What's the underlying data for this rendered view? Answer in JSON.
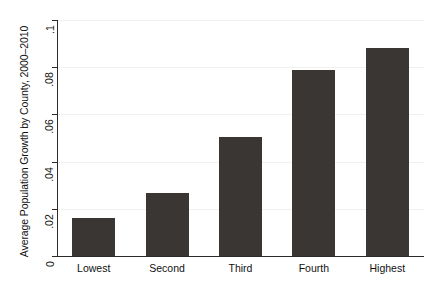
{
  "chart_data": {
    "type": "bar",
    "title": "",
    "xlabel": "",
    "ylabel": "Average Population Growth by County, 2000–2010",
    "categories": [
      "Lowest",
      "Second",
      "Third",
      "Fourth",
      "Highest"
    ],
    "values": [
      0.016,
      0.0265,
      0.0505,
      0.079,
      0.088
    ],
    "ylim": [
      0,
      0.1
    ],
    "yticks": [
      0,
      0.02,
      0.04,
      0.06,
      0.08,
      0.1
    ],
    "ytick_labels": [
      "0",
      ".02",
      ".04",
      ".06",
      ".08",
      ".1"
    ],
    "grid": true,
    "legend": "none",
    "bar_color": "#3a3633",
    "axis_color": "#2e2a27",
    "grid_color": "#f0f0ee",
    "background_color": "#ffffff"
  }
}
